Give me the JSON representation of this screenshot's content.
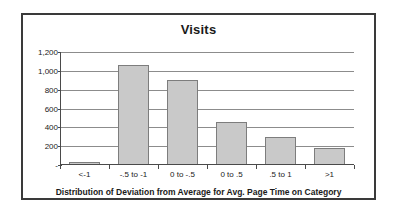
{
  "chart_data": {
    "type": "bar",
    "title": "Visits",
    "xlabel": "Distribution of Deviation from Average for Avg. Page Time on Category",
    "ylabel": "",
    "categories": [
      "<-1",
      "-.5 to -1",
      "0 to -.5",
      "0 to .5",
      ".5 to 1",
      ">1"
    ],
    "values": [
      30,
      1060,
      900,
      460,
      300,
      180
    ],
    "ytick_labels": [
      "1,200",
      "1,000",
      "800",
      "600",
      "400",
      "200",
      "-"
    ],
    "ytick_values": [
      1200,
      1000,
      800,
      600,
      400,
      200,
      0
    ],
    "ylim": [
      0,
      1200
    ],
    "grid": true,
    "legend": false,
    "bar_color": "#c9c9c9",
    "bar_border_color": "#7d7d7d",
    "gridline_color": "#8c8c8c",
    "axis_color": "#4a4a4a",
    "frame_color": "#3a3a3a",
    "background": "#ffffff"
  }
}
